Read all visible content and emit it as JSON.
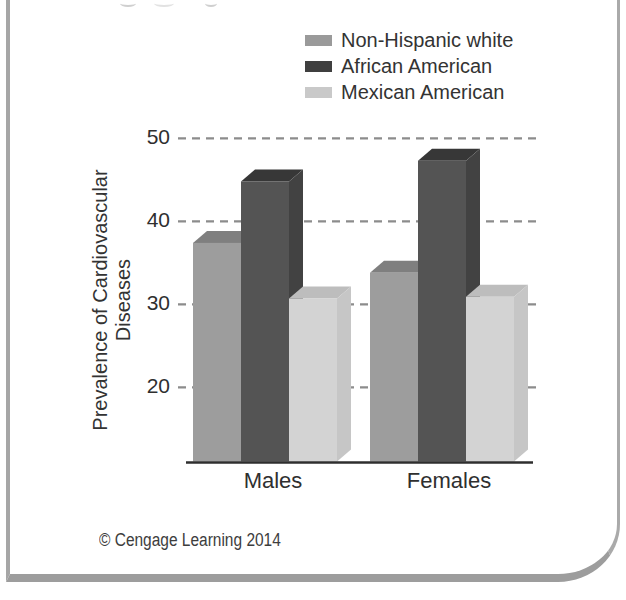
{
  "page": {
    "footer": "© Cengage Learning 2014"
  },
  "legend": {
    "items": [
      {
        "label": "Non-Hispanic white",
        "color": "#9a9a9a"
      },
      {
        "label": "African American",
        "color": "#3f3f3f"
      },
      {
        "label": "Mexican American",
        "color": "#c9c9c9"
      }
    ]
  },
  "chart_data": {
    "type": "bar",
    "style": "3d-grouped",
    "categories": [
      "Males",
      "Females"
    ],
    "series": [
      {
        "name": "Non-Hispanic white",
        "values": [
          37.4,
          33.8
        ],
        "color_front": "#9d9d9d",
        "color_top": "#7f7f7f",
        "color_side": "#868686"
      },
      {
        "name": "African American",
        "values": [
          44.8,
          47.3
        ],
        "color_front": "#545454",
        "color_top": "#373737",
        "color_side": "#424242"
      },
      {
        "name": "Mexican American",
        "values": [
          30.7,
          30.9
        ],
        "color_front": "#d3d3d3",
        "color_top": "#bdbdbd",
        "color_side": "#c6c6c6"
      }
    ],
    "title": "",
    "xlabel": "",
    "ylabel": "Prevalence of Cardiovascular Diseases",
    "ylabel_lines": [
      "Prevalence of Cardiovascular",
      "Diseases"
    ],
    "yticks": [
      20,
      30,
      40,
      50
    ],
    "ylim": [
      11,
      52
    ],
    "grid": "dashed horizontal",
    "grid_color": "#8c8c8c",
    "axis_color": "#2e2e2e",
    "legend_position": "top-right"
  }
}
